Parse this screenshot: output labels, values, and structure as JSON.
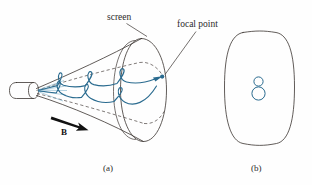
{
  "figure": {
    "title_caption_a": "(a)",
    "title_caption_b": "(b)",
    "labels": {
      "screen": "screen",
      "focal_point": "focal point",
      "magnetic_field": "B"
    },
    "colors": {
      "beam": "#2a6b8f",
      "beam_light": "#7fb3cc",
      "outline": "#3a3330",
      "text": "#2b2b2b",
      "background": "#fefefe"
    },
    "panel_a": {
      "name": "cathode-ray-tube-with-helical-electron-paths",
      "elements": [
        "electron-gun-tube",
        "cone-envelope",
        "screen-ellipse",
        "helical-trajectory-upper",
        "helical-trajectory-lower",
        "focal-point-marker",
        "magnetic-field-arrow"
      ]
    },
    "panel_b": {
      "name": "screen-face-front-view",
      "elements": [
        "screen-face-outline",
        "figure-eight-spot-pattern"
      ]
    }
  }
}
